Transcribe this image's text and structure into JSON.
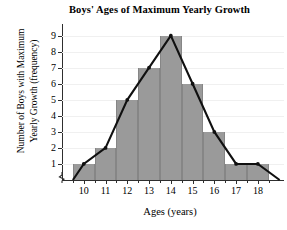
{
  "chart_data": {
    "type": "bar",
    "title": "Boys' Ages of Maximum Yearly Growth",
    "xlabel": "Ages (years)",
    "ylabel_lines": [
      "Number of Boys with Maximum",
      "Yearly Growth (frequency)"
    ],
    "ylabel": "Number of Boys with Maximum Yearly Growth (frequency)",
    "categories": [
      10,
      11,
      12,
      13,
      14,
      15,
      16,
      17,
      18
    ],
    "category_labels": [
      "10",
      "11",
      "12",
      "13",
      "14",
      "15",
      "16",
      "17",
      "18"
    ],
    "values": [
      1,
      2,
      5,
      7,
      9,
      6,
      3,
      1,
      1
    ],
    "series": [
      {
        "name": "Frequency",
        "values": [
          1,
          2,
          5,
          7,
          9,
          6,
          3,
          1,
          1
        ]
      },
      {
        "name": "Frequency polygon",
        "values": [
          1,
          2,
          5,
          7,
          9,
          6,
          3,
          1,
          1
        ]
      }
    ],
    "ylim": [
      0,
      9.6
    ],
    "ytick_labels": [
      "1",
      "2",
      "3",
      "4",
      "5",
      "6",
      "7",
      "8",
      "9"
    ],
    "ytick_values": [
      1,
      2,
      3,
      4,
      5,
      6,
      7,
      8,
      9
    ],
    "xlim": [
      9.0,
      19.2
    ],
    "grid": true,
    "grid_axis": "y",
    "legend": "none",
    "has_axis_break": true,
    "overlay": "frequency-polygon",
    "polygon_points": [
      {
        "x": 9.5,
        "y": 0
      },
      {
        "x": 10,
        "y": 1
      },
      {
        "x": 11,
        "y": 2
      },
      {
        "x": 12,
        "y": 5
      },
      {
        "x": 13,
        "y": 7
      },
      {
        "x": 14,
        "y": 9
      },
      {
        "x": 15,
        "y": 6
      },
      {
        "x": 16,
        "y": 3
      },
      {
        "x": 17,
        "y": 1
      },
      {
        "x": 18,
        "y": 1
      },
      {
        "x": 19,
        "y": 0
      }
    ],
    "colors": {
      "bar_fill": "#9a9a9a",
      "bar_edge": "#868686",
      "line": "#101010",
      "axis": "#2e2e2e",
      "grid": "#f0f0f0",
      "text": "#000000",
      "background": "#ffffff"
    }
  },
  "caption": {
    "text": ""
  }
}
